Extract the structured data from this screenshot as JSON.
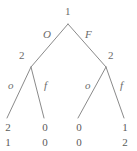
{
  "figure": {
    "kind": "extensive-form-game-tree",
    "stroke_color": "#8a8a8a",
    "text_color": "#6b6b6b",
    "background": "#ffffff"
  },
  "nodes": {
    "root": {
      "player": "1",
      "x": 68,
      "y": 24
    },
    "left": {
      "player": "2",
      "x": 31,
      "y": 67
    },
    "right": {
      "player": "2",
      "x": 106,
      "y": 67
    }
  },
  "edges": [
    {
      "from": "root",
      "to": "left",
      "label": "O"
    },
    {
      "from": "root",
      "to": "right",
      "label": "F"
    },
    {
      "from": "left",
      "to": "leaf1",
      "label": "o"
    },
    {
      "from": "left",
      "to": "leaf2",
      "label": "f"
    },
    {
      "from": "right",
      "to": "leaf3",
      "label": "o"
    },
    {
      "from": "right",
      "to": "leaf4",
      "label": "f"
    }
  ],
  "labels": {
    "root_player": "1",
    "left_player": "2",
    "right_player": "2",
    "edge_O": "O",
    "edge_F": "F",
    "edge_left_o": "o",
    "edge_left_f": "f",
    "edge_right_o": "o",
    "edge_right_f": "f"
  },
  "leaves": [
    {
      "top": "2",
      "bottom": "1"
    },
    {
      "top": "0",
      "bottom": "0"
    },
    {
      "top": "0",
      "bottom": "0"
    },
    {
      "top": "1",
      "bottom": "2"
    }
  ]
}
